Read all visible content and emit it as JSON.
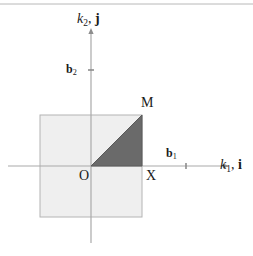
{
  "figure": {
    "type": "geometry-diagram",
    "colors": {
      "background": "#ffffff",
      "square_fill": "#efefef",
      "square_stroke": "#b4b4b4",
      "triangle_fill": "#6a6a6a",
      "triangle_stroke": "#5a5a5a",
      "axis": "#a9a9a9",
      "text": "#1a1a1a",
      "top_rule": "#b8b8b8"
    },
    "axes": {
      "horizontal": {
        "label_main": "k",
        "label_sub": "1",
        "label_vector": "i",
        "label_full": "k₁, i",
        "tick_label_main": "b",
        "tick_label_sub": "1",
        "tick_label_full": "b₁"
      },
      "vertical": {
        "label_main": "k",
        "label_sub": "2",
        "label_vector": "j",
        "label_full": "k₂, j",
        "tick_label_main": "b",
        "tick_label_sub": "2",
        "tick_label_full": "b₂"
      }
    },
    "points": [
      {
        "id": "origin",
        "label": "O",
        "x": 91,
        "y": 166
      },
      {
        "id": "corner",
        "label": "X",
        "x": 142,
        "y": 166
      },
      {
        "id": "vertex",
        "label": "M",
        "x": 142,
        "y": 115
      }
    ],
    "square": {
      "x0": 40,
      "y0": 115,
      "x1": 142,
      "y1": 217
    },
    "triangle": {
      "vertices": "91,166 142,166 142,115"
    }
  }
}
